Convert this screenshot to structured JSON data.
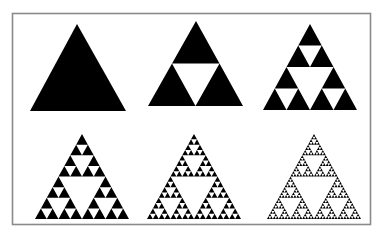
{
  "figure": {
    "background": "#ffffff",
    "fill_color": "#000000",
    "frame": {
      "x": 12.5,
      "y": 13.5,
      "width": 358,
      "height": 211,
      "stroke": "#8a8a8a"
    },
    "panels": [
      {
        "label": "iteration-0",
        "depth": 0,
        "apex": [
          77,
          24
        ],
        "base_y": 111,
        "base_left": 30,
        "base_right": 126
      },
      {
        "label": "iteration-1",
        "depth": 1,
        "apex": [
          196,
          21
        ],
        "base_y": 106,
        "base_left": 148,
        "base_right": 243
      },
      {
        "label": "iteration-2",
        "depth": 2,
        "apex": [
          310,
          24
        ],
        "base_y": 110,
        "base_left": 263,
        "base_right": 357
      },
      {
        "label": "iteration-3",
        "depth": 3,
        "apex": [
          82,
          134
        ],
        "base_y": 219,
        "base_left": 35,
        "base_right": 129
      },
      {
        "label": "iteration-4",
        "depth": 4,
        "apex": [
          194,
          134
        ],
        "base_y": 219,
        "base_left": 147,
        "base_right": 241
      },
      {
        "label": "iteration-5",
        "depth": 5,
        "apex": [
          314,
          134
        ],
        "base_y": 219,
        "base_left": 267,
        "base_right": 361
      }
    ]
  }
}
